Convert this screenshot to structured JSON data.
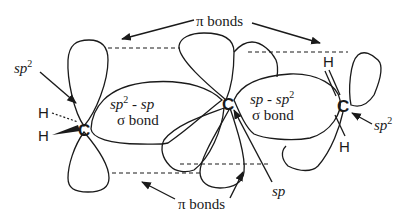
{
  "diagram": {
    "labels": {
      "pi_bonds_top": "π bonds",
      "pi_bonds_bottom": "π bonds",
      "sp2_left": "sp",
      "sp2_left_sup": "2",
      "sp2_right": "sp",
      "sp2_right_sup": "2",
      "sp_center": "sp",
      "sigma_left_line1_a": "sp",
      "sigma_left_line1_sup": "2",
      "sigma_left_line1_b": " - sp",
      "sigma_left_line2": "σ bond",
      "sigma_right_line1_a": "sp - sp",
      "sigma_right_line1_sup": "2",
      "sigma_right_line2": "σ bond"
    },
    "atoms": {
      "c_left": "C",
      "c_center": "C",
      "c_right": "C",
      "h_left_top": "H",
      "h_left_bottom": "H",
      "h_right_top": "H",
      "h_right_bottom": "H"
    },
    "colors": {
      "stroke": "#1a1a1a",
      "background": "#ffffff"
    }
  }
}
